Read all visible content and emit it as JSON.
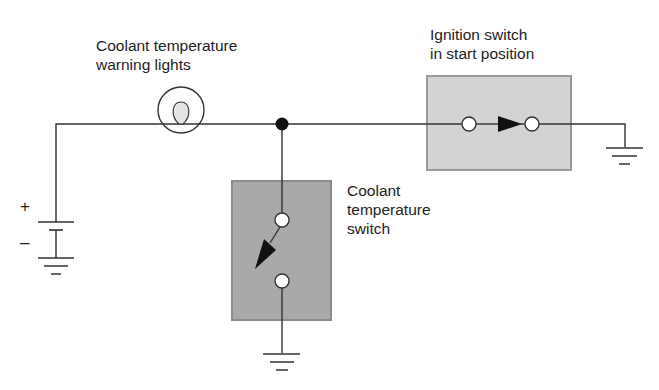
{
  "diagram": {
    "type": "circuit-schematic",
    "labels": {
      "warning_light": {
        "line1": "Coolant temperature",
        "line2": "warning lights"
      },
      "ignition_switch": {
        "line1": "Ignition switch",
        "line2": "in start position"
      },
      "coolant_switch": {
        "line1": "Coolant",
        "line2": "temperature",
        "line3": "switch"
      },
      "battery_positive": "+",
      "battery_negative": "–"
    },
    "components": [
      {
        "id": "battery",
        "kind": "battery",
        "icon": "battery-icon"
      },
      {
        "id": "warning_lamp",
        "kind": "lamp",
        "icon": "lamp-icon"
      },
      {
        "id": "junction",
        "kind": "junction-node",
        "icon": "junction-dot-icon"
      },
      {
        "id": "ignition_switch",
        "kind": "switch",
        "state": "closed (start position)",
        "icon": "switch-closed-icon"
      },
      {
        "id": "coolant_switch",
        "kind": "switch",
        "state": "open",
        "icon": "switch-open-icon"
      },
      {
        "id": "ground_battery",
        "kind": "ground",
        "icon": "ground-icon"
      },
      {
        "id": "ground_coolant",
        "kind": "ground",
        "icon": "ground-icon"
      },
      {
        "id": "ground_ignition",
        "kind": "ground",
        "icon": "ground-icon"
      }
    ],
    "colors": {
      "wire": "#333333",
      "coolant_box_fill": "#a9a9a9",
      "coolant_box_border": "#8c8c8c",
      "ignition_box_fill": "#d3d3d3",
      "ignition_box_border": "#9a9a9a",
      "lamp_filament_fill": "#e4e4e4",
      "junction": "#111111"
    }
  }
}
